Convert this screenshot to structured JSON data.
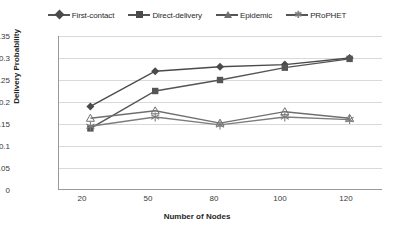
{
  "chart_data": {
    "type": "line",
    "title": "",
    "xlabel": "Number of Nodes",
    "ylabel": "Delivery Probability",
    "categories": [
      "20",
      "50",
      "80",
      "100",
      "120"
    ],
    "x": [
      20,
      50,
      80,
      100,
      120
    ],
    "ylim": [
      0,
      0.35
    ],
    "ytick_labels": [
      "0",
      "0.05",
      "0.1",
      "0.15",
      "0.2",
      "0.25",
      "0.3",
      "0.35"
    ],
    "ytick_values": [
      0,
      0.05,
      0.1,
      0.15,
      0.2,
      0.25,
      0.3,
      0.35
    ],
    "grid": true,
    "legend_position": "top",
    "series": [
      {
        "name": "First-contact",
        "marker": "diamond",
        "color": "#4a4a4a",
        "values": [
          0.19,
          0.27,
          0.28,
          0.285,
          0.3
        ]
      },
      {
        "name": "Direct-delivery",
        "marker": "square",
        "color": "#555555",
        "values": [
          0.14,
          0.225,
          0.25,
          0.278,
          0.298
        ]
      },
      {
        "name": "Epidemic",
        "marker": "triangle",
        "color": "#6f6f6f",
        "values": [
          0.163,
          0.18,
          0.152,
          0.178,
          0.163
        ]
      },
      {
        "name": "PRoPHET",
        "marker": "star",
        "color": "#7d7d7d",
        "values": [
          0.145,
          0.166,
          0.148,
          0.166,
          0.16
        ]
      }
    ]
  },
  "legend": {
    "items": [
      {
        "label": "First-contact",
        "marker": "diamond-marker-icon"
      },
      {
        "label": "Direct-delivery",
        "marker": "square-marker-icon"
      },
      {
        "label": "Epidemic",
        "marker": "triangle-marker-icon"
      },
      {
        "label": "PRoPHET",
        "marker": "star-marker-icon"
      }
    ]
  },
  "axes": {
    "y_title": "Delivery Probability",
    "x_title": "Number of Nodes",
    "y_ticks": [
      "0.35",
      "0.3",
      "0.25",
      "0.2",
      "0.15",
      "0.1",
      "0.05",
      "0"
    ],
    "x_ticks": [
      "20",
      "50",
      "80",
      "100",
      "120"
    ]
  }
}
